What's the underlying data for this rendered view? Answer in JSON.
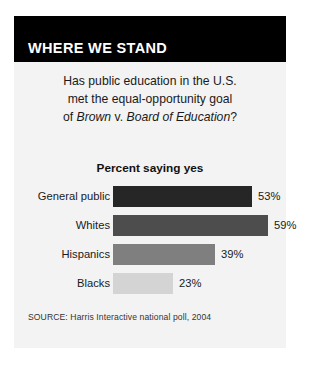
{
  "header": {
    "title": "WHERE WE STAND",
    "background": "#000000",
    "text_color": "#ffffff"
  },
  "question": {
    "line1": "Has public education in the U.S.",
    "line2": "met the equal-opportunity goal",
    "line3_prefix": "of ",
    "line3_italic1": "Brown",
    "line3_mid": " v. ",
    "line3_italic2": "Board of Education",
    "line3_suffix": "?"
  },
  "subtitle": "Percent saying yes",
  "source": "SOURCE: Harris Interactive national poll, 2004",
  "card": {
    "background": "#f3f3f3",
    "page_background": "#ffffff"
  },
  "chart_data": {
    "type": "bar",
    "title": "Percent saying yes",
    "xlabel": "",
    "ylabel": "",
    "orientation": "horizontal",
    "xlim": [
      0,
      100
    ],
    "grid": false,
    "legend": "none",
    "categories": [
      "General public",
      "Whites",
      "Hispanics",
      "Blacks"
    ],
    "values": [
      53,
      59,
      39,
      23
    ],
    "value_labels": [
      "53%",
      "59%",
      "39%",
      "23%"
    ],
    "colors": [
      "#262626",
      "#4d4d4d",
      "#7f7f7f",
      "#d4d4d4"
    ]
  }
}
